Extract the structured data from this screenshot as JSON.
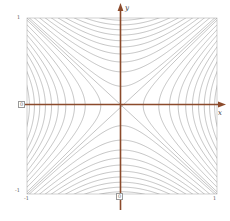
{
  "figure": {
    "title": "",
    "background_color": "#ffffff"
  },
  "axes": {
    "x_axis_label": "x",
    "y_axis_label": "y",
    "axis_color": "#8b4a2b",
    "frame_color": "#b9b9b9",
    "curve_color": "#8a8a8a"
  },
  "ticks": {
    "x_left_label": "-1",
    "x_right_label": "1",
    "x_origin_label": "0",
    "y_top_label": "1",
    "y_bottom_label": "-1",
    "y_origin_label": "0"
  },
  "chart_data": {
    "type": "line",
    "title": "",
    "xlabel": "x",
    "ylabel": "y",
    "xlim": [
      -1,
      1
    ],
    "ylim": [
      -1,
      1
    ],
    "grid": false,
    "legend": "none",
    "contour_levels": [
      -0.95,
      -0.85,
      -0.75,
      -0.65,
      -0.55,
      -0.45,
      -0.35,
      -0.25,
      -0.15,
      -0.05,
      0.05,
      0.15,
      0.25,
      0.35,
      0.45,
      0.55,
      0.65,
      0.75,
      0.85,
      0.95
    ],
    "asymptotes": [
      "y = x",
      "y = -x"
    ],
    "series": [
      {
        "name": "upper branches",
        "values": [
          0.05,
          0.15,
          0.25,
          0.35,
          0.45,
          0.55,
          0.65,
          0.75,
          0.85,
          0.95
        ]
      },
      {
        "name": "lower branches",
        "values": [
          -0.05,
          -0.15,
          -0.25,
          -0.35,
          -0.45,
          -0.55,
          -0.65,
          -0.75,
          -0.85,
          -0.95
        ]
      }
    ],
    "x_ticks": [
      -1,
      0,
      1
    ],
    "y_ticks": [
      -1,
      0,
      1
    ],
    "x_tick_labels": [
      "-1",
      "0",
      "1"
    ],
    "y_tick_labels": [
      "-1",
      "0",
      "1"
    ]
  }
}
